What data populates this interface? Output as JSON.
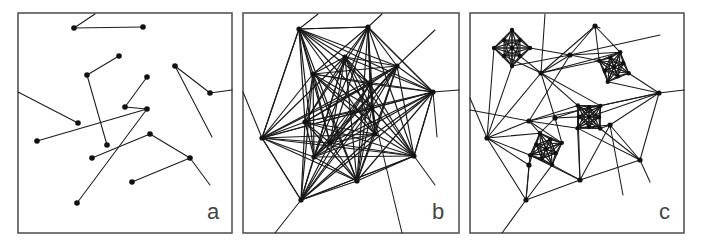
{
  "figure": {
    "panels": [
      {
        "id": "a",
        "label": "a",
        "frame": {
          "x": 18,
          "y": 13,
          "w": 214,
          "h": 220
        },
        "label_pos": {
          "x": 207,
          "y": 201
        },
        "nodes": [
          [
            74,
            28
          ],
          [
            143,
            27
          ],
          [
            119,
            56
          ],
          [
            87,
            75
          ],
          [
            147,
            77
          ],
          [
            175,
            66
          ],
          [
            210,
            93
          ],
          [
            125,
            107
          ],
          [
            147,
            109
          ],
          [
            78,
            123
          ],
          [
            37,
            141
          ],
          [
            107,
            145
          ],
          [
            150,
            134
          ],
          [
            92,
            158
          ],
          [
            190,
            158
          ],
          [
            132,
            182
          ],
          [
            77,
            203
          ]
        ],
        "edges": [
          [
            0,
            [
              95,
              14
            ]
          ],
          [
            0,
            1
          ],
          [
            2,
            3
          ],
          [
            3,
            11
          ],
          [
            4,
            7
          ],
          [
            7,
            8
          ],
          [
            8,
            10
          ],
          [
            8,
            16
          ],
          [
            9,
            [
              18,
              92
            ]
          ],
          [
            5,
            6
          ],
          [
            6,
            [
              232,
              90
            ]
          ],
          [
            5,
            [
              212,
              137
            ]
          ],
          [
            12,
            13
          ],
          [
            12,
            14
          ],
          [
            14,
            15
          ],
          [
            14,
            [
              210,
              185
            ]
          ]
        ]
      },
      {
        "id": "b",
        "label": "b",
        "frame": {
          "x": 243,
          "y": 13,
          "w": 216,
          "h": 220
        },
        "label_pos": {
          "x": 432,
          "y": 201
        },
        "nodes": [
          [
            299,
            29
          ],
          [
            368,
            27
          ],
          [
            345,
            57
          ],
          [
            313,
            74
          ],
          [
            397,
            66
          ],
          [
            433,
            92
          ],
          [
            370,
            84
          ],
          [
            372,
            108
          ],
          [
            305,
            122
          ],
          [
            262,
            138
          ],
          [
            330,
            143
          ],
          [
            314,
            157
          ],
          [
            375,
            134
          ],
          [
            414,
            156
          ],
          [
            357,
            181
          ],
          [
            301,
            200
          ]
        ],
        "edges": "complete",
        "extra_edges": [
          [
            0,
            [
              318,
              14
            ]
          ],
          [
            1,
            [
              382,
              14
            ]
          ],
          [
            9,
            [
              243,
              92
            ]
          ],
          [
            4,
            [
              435,
              30
            ]
          ],
          [
            5,
            [
              459,
              90
            ]
          ],
          [
            5,
            [
              437,
              137
            ]
          ],
          [
            13,
            [
              435,
              185
            ]
          ],
          [
            15,
            [
              275,
              233
            ]
          ],
          [
            7,
            [
              402,
              233
            ]
          ],
          [
            0,
            9
          ],
          [
            9,
            15
          ],
          [
            15,
            13
          ],
          [
            13,
            5
          ],
          [
            0,
            1
          ],
          [
            1,
            5
          ]
        ],
        "skip_pairs": [
          [
            0,
            15
          ],
          [
            0,
            13
          ],
          [
            1,
            15
          ],
          [
            1,
            9
          ]
        ]
      },
      {
        "id": "c",
        "label": "c",
        "frame": {
          "x": 470,
          "y": 13,
          "w": 214,
          "h": 220
        },
        "label_pos": {
          "x": 659,
          "y": 201
        },
        "nodes": [
          [
            595,
            26
          ],
          [
            570,
            55
          ],
          [
            541,
            73
          ],
          [
            487,
            138
          ],
          [
            529,
            121
          ],
          [
            659,
            93
          ],
          [
            529,
            165
          ],
          [
            580,
            180
          ],
          [
            640,
            160
          ],
          [
            526,
            200
          ],
          [
            555,
            118
          ],
          [
            610,
            125
          ]
        ],
        "clusters": [
          {
            "center": [
              512,
              48
            ],
            "r": 18,
            "n": 8
          },
          {
            "center": [
              614,
              67
            ],
            "r": 16,
            "n": 8
          },
          {
            "center": [
              589,
              117
            ],
            "r": 16,
            "n": 8
          },
          {
            "center": [
              546,
              149
            ],
            "r": 17,
            "n": 8
          }
        ],
        "edges": [
          [
            0,
            2
          ],
          [
            0,
            1
          ],
          [
            0,
            "c1"
          ],
          [
            1,
            "c0"
          ],
          [
            1,
            2
          ],
          [
            1,
            4
          ],
          [
            1,
            "c1"
          ],
          [
            2,
            "c0"
          ],
          [
            2,
            3
          ],
          [
            2,
            10
          ],
          [
            2,
            "c1"
          ],
          [
            2,
            "c2"
          ],
          [
            3,
            "c0"
          ],
          [
            3,
            4
          ],
          [
            3,
            "c3"
          ],
          [
            3,
            9
          ],
          [
            3,
            6
          ],
          [
            4,
            "c3"
          ],
          [
            4,
            "c2"
          ],
          [
            4,
            5
          ],
          [
            5,
            "c1"
          ],
          [
            5,
            "c2"
          ],
          [
            5,
            8
          ],
          [
            5,
            11
          ],
          [
            6,
            "c3"
          ],
          [
            6,
            9
          ],
          [
            7,
            "c3"
          ],
          [
            7,
            "c2"
          ],
          [
            7,
            9
          ],
          [
            7,
            8
          ],
          [
            8,
            "c2"
          ],
          [
            8,
            11
          ],
          [
            9,
            "c3"
          ],
          [
            10,
            "c3"
          ],
          [
            10,
            "c2"
          ],
          [
            11,
            "c2"
          ],
          [
            11,
            7
          ],
          [
            0,
            [
              600,
              28
            ]
          ],
          [
            1,
            [
              660,
              35
            ]
          ],
          [
            3,
            [
              470,
              98
            ]
          ],
          [
            5,
            [
              684,
              90
            ]
          ],
          [
            9,
            [
              502,
              233
            ]
          ],
          [
            11,
            [
              623,
              195
            ]
          ],
          [
            8,
            [
              650,
              182
            ]
          ],
          [
            2,
            [
              545,
              14
            ]
          ],
          [
            4,
            [
              470,
              110
            ]
          ]
        ]
      }
    ]
  },
  "colors": {
    "edge": "#1a1a1a",
    "node": "#111111",
    "frame": "#555555",
    "label": "#444444",
    "background": "#ffffff"
  }
}
